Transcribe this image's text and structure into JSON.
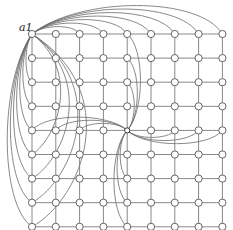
{
  "diagram": {
    "type": "grid-graph",
    "rows": 9,
    "cols": 9,
    "origin_x": 32,
    "origin_y": 34,
    "spacing_x": 23.8,
    "spacing_y": 24.1,
    "node_radius": 3.6,
    "colors": {
      "edge": "#6b6b6b",
      "grid": "#7a7a7a",
      "node_stroke": "#555555",
      "node_fill": "#ffffff",
      "background": "#ffffff"
    },
    "special_vertices": [
      {
        "id": "a1",
        "label": "a1",
        "row": 0,
        "col": 0,
        "connected_to": "all nodes in top row and left column via arcs"
      },
      {
        "id": "hub",
        "label": "",
        "row": 4,
        "col": 4,
        "connected_to": "all nodes in its row and column via arcs"
      }
    ]
  },
  "labels": {
    "a1": "a1"
  }
}
